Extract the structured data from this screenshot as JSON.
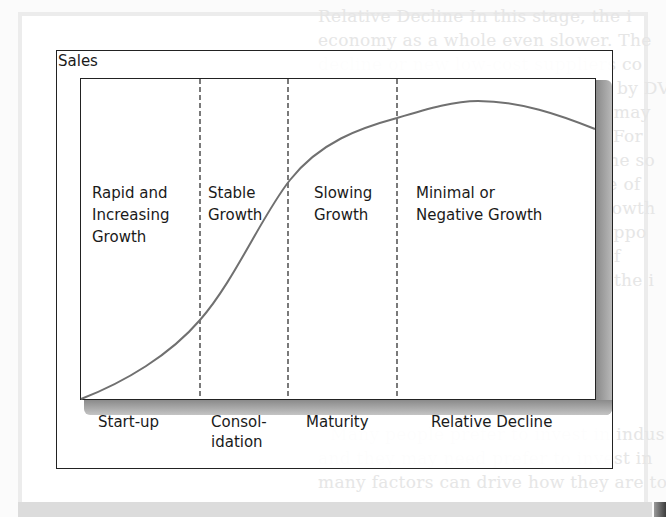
{
  "diagram": {
    "y_axis_label": "Sales",
    "curve_color": "#6f6f6f",
    "phases": [
      {
        "line1": "Rapid and",
        "line2": "Increasing",
        "line3": "Growth"
      },
      {
        "line1": "Stable",
        "line2": "Growth"
      },
      {
        "line1": "Slowing",
        "line2": "Growth"
      },
      {
        "line1": "Minimal or",
        "line2": "Negative Growth"
      }
    ],
    "stages": [
      {
        "line1": "Start-up"
      },
      {
        "line1": "Consol-",
        "line2": "idation"
      },
      {
        "line1": "Maturity"
      },
      {
        "line1": "Relative Decline"
      }
    ]
  },
  "background_text": {
    "lines": [
      "Relative Decline  In this stage, the i",
      "economy as a whole even slower. The",
      "decline or new low-cost suppliers co",
      "the steady displacement of VCRs by DV",
      "A further stage in the life cycle may",
      "conventional growth companies. For",
      "and growth of the industry and the so",
      "trends, the financial performance of",
      "profits (earnings compounded growth",
      "vices bring about new business oppo",
      "tiatives, and finally the number of",
      "the industry life cycle to analyze the i",
      "",
      "Many people prefer to invest in indus",
      "and they may need prefer to invest in",
      "many factors can drive how they are to"
    ]
  }
}
